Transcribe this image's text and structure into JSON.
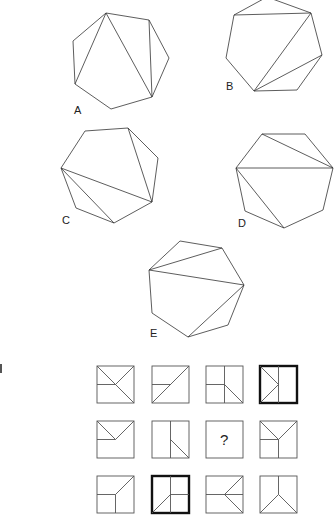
{
  "figures": {
    "heptagons": [
      {
        "label": "A",
        "label_pos": [
          74,
          104
        ],
        "vertices": [
          [
            106,
            13
          ],
          [
            149,
            20
          ],
          [
            169,
            58
          ],
          [
            152,
            97
          ],
          [
            111,
            109
          ],
          [
            75,
            84
          ],
          [
            73,
            41
          ]
        ],
        "diagonals": [
          [
            [
              106,
              13
            ],
            [
              75,
              84
            ]
          ],
          [
            [
              106,
              13
            ],
            [
              152,
              97
            ]
          ],
          [
            [
              149,
              20
            ],
            [
              152,
              97
            ]
          ]
        ]
      },
      {
        "label": "B",
        "label_pos": [
          226,
          80
        ],
        "vertices": [
          [
            267,
            -3
          ],
          [
            311,
            13
          ],
          [
            322,
            55
          ],
          [
            297,
            90
          ],
          [
            254,
            91
          ],
          [
            226,
            58
          ],
          [
            234,
            15
          ]
        ],
        "diagonals": [
          [
            [
              234,
              15
            ],
            [
              311,
              13
            ]
          ],
          [
            [
              311,
              13
            ],
            [
              254,
              91
            ]
          ],
          [
            [
              322,
              55
            ],
            [
              254,
              91
            ]
          ]
        ]
      },
      {
        "label": "C",
        "label_pos": [
          62,
          214
        ],
        "vertices": [
          [
            85,
            131
          ],
          [
            128,
            128
          ],
          [
            158,
            158
          ],
          [
            152,
            202
          ],
          [
            114,
            223
          ],
          [
            76,
            208
          ],
          [
            61,
            168
          ]
        ],
        "diagonals": [
          [
            [
              128,
              128
            ],
            [
              152,
              202
            ]
          ],
          [
            [
              61,
              168
            ],
            [
              152,
              202
            ]
          ],
          [
            [
              61,
              168
            ],
            [
              114,
              223
            ]
          ]
        ]
      },
      {
        "label": "D",
        "label_pos": [
          238,
          217
        ],
        "vertices": [
          [
            262,
            134
          ],
          [
            305,
            134
          ],
          [
            333,
            168
          ],
          [
            323,
            210
          ],
          [
            284,
            228
          ],
          [
            245,
            211
          ],
          [
            236,
            168
          ]
        ],
        "diagonals": [
          [
            [
              262,
              134
            ],
            [
              333,
              168
            ]
          ],
          [
            [
              236,
              168
            ],
            [
              333,
              168
            ]
          ],
          [
            [
              236,
              168
            ],
            [
              284,
              228
            ]
          ]
        ]
      },
      {
        "label": "E",
        "label_pos": [
          150,
          327
        ],
        "vertices": [
          [
            180,
            241
          ],
          [
            222,
            248
          ],
          [
            244,
            285
          ],
          [
            228,
            325
          ],
          [
            188,
            337
          ],
          [
            152,
            313
          ],
          [
            149,
            270
          ]
        ],
        "diagonals": [
          [
            [
              149,
              270
            ],
            [
              222,
              248
            ]
          ],
          [
            [
              149,
              270
            ],
            [
              244,
              285
            ]
          ],
          [
            [
              244,
              285
            ],
            [
              188,
              337
            ]
          ]
        ]
      }
    ]
  },
  "matrix": {
    "question_mark": "?",
    "rows": [
      [
        {
          "x": 97,
          "y": 366,
          "bold": false,
          "lines": [
            [
              0,
              0,
              1,
              1
            ],
            [
              1,
              0,
              0.5,
              0.5
            ],
            [
              0,
              0.5,
              0.5,
              0.5
            ]
          ]
        },
        {
          "x": 152,
          "y": 366,
          "bold": false,
          "lines": [
            [
              1,
              0,
              0,
              1
            ],
            [
              0,
              0.5,
              0.5,
              0.5
            ]
          ]
        },
        {
          "x": 206,
          "y": 366,
          "bold": false,
          "lines": [
            [
              0.5,
              0,
              0.5,
              1
            ],
            [
              0,
              0.5,
              0.5,
              0.5
            ],
            [
              0.5,
              0.5,
              1,
              1
            ]
          ]
        },
        {
          "x": 260,
          "y": 366,
          "bold": true,
          "lines": [
            [
              0.5,
              0,
              0.5,
              1
            ],
            [
              0,
              0,
              0.5,
              0.5
            ],
            [
              0.5,
              0.5,
              0,
              1
            ]
          ]
        }
      ],
      [
        {
          "x": 97,
          "y": 421,
          "bold": false,
          "lines": [
            [
              0,
              0,
              0.5,
              0.5
            ],
            [
              1,
              0,
              0.5,
              0.5
            ],
            [
              0,
              0.5,
              0.5,
              0.5
            ]
          ]
        },
        {
          "x": 152,
          "y": 421,
          "bold": false,
          "lines": [
            [
              0.5,
              0,
              0.5,
              1
            ],
            [
              0.5,
              0.5,
              1,
              1
            ]
          ]
        },
        {
          "x": 206,
          "y": 421,
          "bold": false,
          "question": true,
          "lines": []
        },
        {
          "x": 260,
          "y": 421,
          "bold": false,
          "lines": [
            [
              0,
              0,
              0.5,
              0.5
            ],
            [
              1,
              0,
              0.5,
              0.5
            ],
            [
              0,
              0.5,
              0.5,
              0.5
            ],
            [
              0.5,
              0.5,
              0.5,
              1
            ]
          ]
        }
      ],
      [
        {
          "x": 97,
          "y": 476,
          "bold": false,
          "lines": [
            [
              1,
              0,
              0.5,
              0.5
            ],
            [
              0,
              0.5,
              0.5,
              0.5
            ],
            [
              0.5,
              0.5,
              0.5,
              1
            ]
          ]
        },
        {
          "x": 152,
          "y": 476,
          "bold": true,
          "lines": [
            [
              0.5,
              0,
              0.5,
              1
            ],
            [
              0.5,
              0.5,
              1,
              0.5
            ],
            [
              0.5,
              0.5,
              0,
              1
            ]
          ]
        },
        {
          "x": 206,
          "y": 476,
          "bold": false,
          "lines": [
            [
              0,
              0.5,
              1,
              0.5
            ],
            [
              0.5,
              0.5,
              1,
              0
            ],
            [
              0.5,
              0.5,
              1,
              1
            ]
          ]
        },
        {
          "x": 260,
          "y": 476,
          "bold": false,
          "lines": [
            [
              0.5,
              0,
              0.5,
              0.5
            ],
            [
              0.5,
              0.5,
              0,
              1
            ],
            [
              0.5,
              0.5,
              1,
              1
            ]
          ]
        }
      ]
    ],
    "cell_size": 37
  }
}
